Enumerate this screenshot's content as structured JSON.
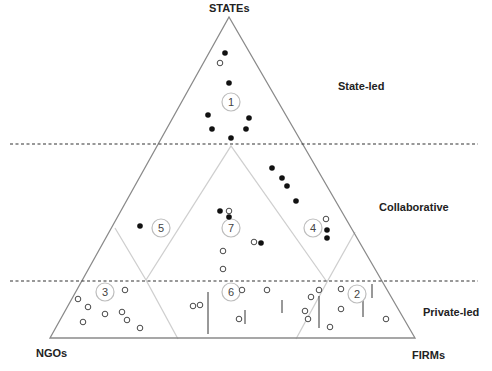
{
  "vertices": {
    "top": "STATEs",
    "bottom_left": "NGOs",
    "bottom_right": "FIRMs"
  },
  "bands": [
    {
      "label": "State-led"
    },
    {
      "label": "Collaborative"
    },
    {
      "label": "Private-led"
    }
  ],
  "regions": [
    {
      "id": "1",
      "x": 231,
      "y": 102
    },
    {
      "id": "2",
      "x": 357,
      "y": 294
    },
    {
      "id": "3",
      "x": 105,
      "y": 292
    },
    {
      "id": "4",
      "x": 313,
      "y": 228
    },
    {
      "id": "5",
      "x": 161,
      "y": 228
    },
    {
      "id": "6",
      "x": 231,
      "y": 292
    },
    {
      "id": "7",
      "x": 231,
      "y": 228
    }
  ],
  "filled_points": [
    [
      225,
      53
    ],
    [
      229,
      83
    ],
    [
      208,
      115
    ],
    [
      249,
      118
    ],
    [
      212,
      129
    ],
    [
      246,
      129
    ],
    [
      231,
      138
    ],
    [
      272,
      168
    ],
    [
      282,
      178
    ],
    [
      287,
      186
    ],
    [
      296,
      201
    ],
    [
      327,
      230
    ],
    [
      327,
      238
    ],
    [
      140,
      226
    ],
    [
      220,
      211
    ],
    [
      229,
      217
    ],
    [
      261,
      243
    ]
  ],
  "open_points": [
    [
      220,
      63
    ],
    [
      229,
      211
    ],
    [
      254,
      242
    ],
    [
      223,
      251
    ],
    [
      223,
      269
    ],
    [
      326,
      219
    ],
    [
      319,
      290
    ],
    [
      78,
      299
    ],
    [
      125,
      290
    ],
    [
      88,
      307
    ],
    [
      105,
      314
    ],
    [
      122,
      312
    ],
    [
      83,
      322
    ],
    [
      127,
      320
    ],
    [
      140,
      328
    ],
    [
      193,
      306
    ],
    [
      200,
      305
    ],
    [
      242,
      290
    ],
    [
      267,
      290
    ],
    [
      239,
      319
    ],
    [
      305,
      311
    ],
    [
      341,
      289
    ],
    [
      341,
      309
    ],
    [
      308,
      319
    ],
    [
      330,
      327
    ],
    [
      386,
      319
    ],
    [
      311,
      297
    ]
  ],
  "whisker_lines": [
    [
      208,
      292,
      208,
      334
    ],
    [
      245,
      310,
      245,
      324
    ],
    [
      282,
      300,
      282,
      313
    ],
    [
      319,
      296,
      319,
      328
    ],
    [
      363,
      296,
      363,
      317
    ],
    [
      372,
      284,
      372,
      298
    ]
  ],
  "colors": {
    "outer_line": "#8a8a8a",
    "inner_line": "#cfcfcf",
    "dashed": "#333333",
    "point": "#111111"
  }
}
